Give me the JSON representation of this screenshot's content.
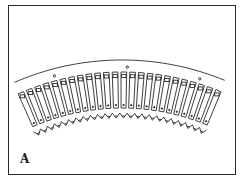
{
  "figure": {
    "panel_label": "A",
    "tooth_count": 24,
    "colors": {
      "line": "#2a2a2a",
      "background": "#ffffff"
    }
  }
}
